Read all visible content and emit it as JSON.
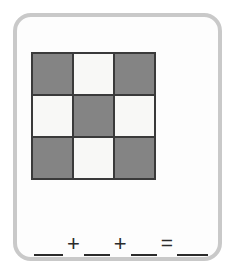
{
  "card": {
    "border_color": "#c9c9c9",
    "background_color": "#fdfdfd"
  },
  "grid_figure": {
    "name": "three-by-three-checkerboard",
    "rows": 3,
    "columns": 3,
    "shaded_color": "#848484",
    "empty_color": "#f8f8f6",
    "divider_color": "#3a3a3a",
    "shaded_count": 5,
    "empty_count": 4,
    "cells": [
      {
        "row": 1,
        "col": 1,
        "state": "shaded"
      },
      {
        "row": 1,
        "col": 2,
        "state": "empty"
      },
      {
        "row": 1,
        "col": 3,
        "state": "shaded"
      },
      {
        "row": 2,
        "col": 1,
        "state": "empty"
      },
      {
        "row": 2,
        "col": 2,
        "state": "shaded"
      },
      {
        "row": 2,
        "col": 3,
        "state": "empty"
      },
      {
        "row": 3,
        "col": 1,
        "state": "shaded"
      },
      {
        "row": 3,
        "col": 2,
        "state": "empty"
      },
      {
        "row": 3,
        "col": 3,
        "state": "shaded"
      }
    ]
  },
  "equation": {
    "blank_1": "",
    "operator_1": "+",
    "blank_2": "",
    "operator_2": "+",
    "blank_3": "",
    "operator_3": "=",
    "blank_4": "",
    "full_text": "__ + __ + __ = __"
  }
}
